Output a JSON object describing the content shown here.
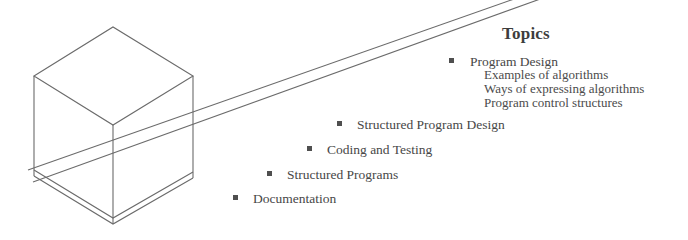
{
  "figure": {
    "heading": "Topics",
    "bullet_glyph": "filled-square",
    "ink_color": "#4a4a4a",
    "background_color": "#ffffff"
  },
  "topics": [
    {
      "label": "Program Design",
      "bullet_x": 449,
      "text_x": 470,
      "y": 54
    },
    {
      "label": "Structured Program Design",
      "bullet_x": 337,
      "text_x": 357,
      "y": 117
    },
    {
      "label": "Coding and Testing",
      "bullet_x": 307,
      "text_x": 327,
      "y": 142
    },
    {
      "label": "Structured Programs",
      "bullet_x": 267,
      "text_x": 287,
      "y": 167
    },
    {
      "label": "Documentation",
      "bullet_x": 233,
      "text_x": 253,
      "y": 191
    }
  ],
  "subtopics": [
    "Examples of algorithms",
    "Ways of expressing algorithms",
    "Program control structures"
  ],
  "artwork": {
    "name": "isometric-cube-on-ramp",
    "description": "Wireframe isometric cube resting on a thin slab with a long ramp rising to the upper right",
    "line_color": "#6b6b6b"
  }
}
